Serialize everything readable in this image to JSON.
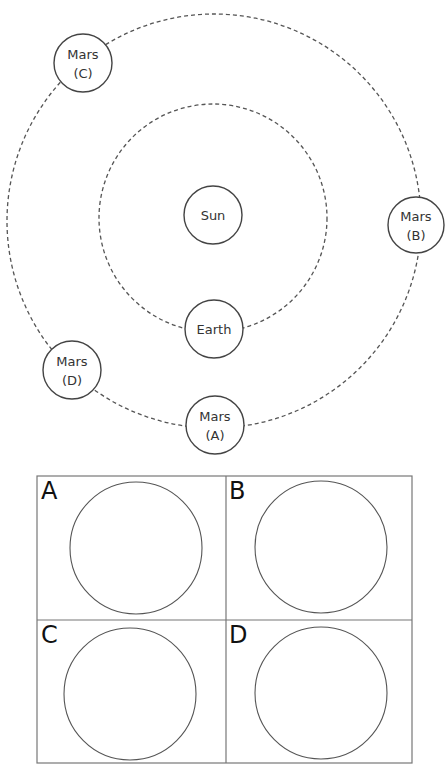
{
  "diagram": {
    "orbits": [
      {
        "name": "earth-orbit"
      },
      {
        "name": "mars-orbit"
      }
    ],
    "bodies": [
      {
        "id": "sun",
        "lines": [
          "Sun"
        ]
      },
      {
        "id": "earth",
        "lines": [
          "Earth"
        ]
      },
      {
        "id": "mars-a",
        "lines": [
          "Mars",
          "(A)"
        ]
      },
      {
        "id": "mars-b",
        "lines": [
          "Mars",
          "(B)"
        ]
      },
      {
        "id": "mars-c",
        "lines": [
          "Mars",
          "(C)"
        ]
      },
      {
        "id": "mars-d",
        "lines": [
          "Mars",
          "(D)"
        ]
      }
    ]
  },
  "answer_grid": {
    "panels": [
      {
        "letter": "A"
      },
      {
        "letter": "B"
      },
      {
        "letter": "C"
      },
      {
        "letter": "D"
      }
    ]
  }
}
